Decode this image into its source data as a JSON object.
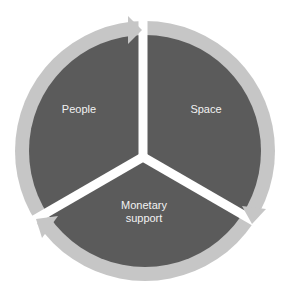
{
  "diagram": {
    "type": "cycle",
    "colors": {
      "sector": "#5b5b5b",
      "ring": "#c6c6c6",
      "gap": "#ffffff"
    },
    "sectors": [
      {
        "label": "People"
      },
      {
        "label": "Space"
      },
      {
        "label": "Monetary",
        "label2": "support"
      }
    ]
  }
}
